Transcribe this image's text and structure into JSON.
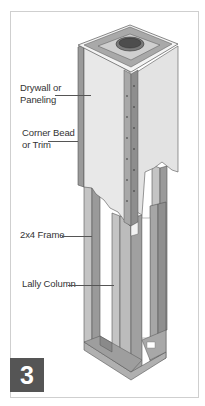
{
  "figure": {
    "number": "3",
    "colors": {
      "panel_face": "#e8e8e8",
      "panel_side": "#d2d2d2",
      "wood": "#b9b9b9",
      "wood_dark": "#8f8f8f",
      "badge": "#555555",
      "border": "#cfcfcf"
    }
  },
  "labels": [
    {
      "id": "drywall",
      "text_line1": "Drywall or",
      "text_line2": "Paneling"
    },
    {
      "id": "corner_bead",
      "text_line1": "Corner Bead",
      "text_line2": "or Trim"
    },
    {
      "id": "frame",
      "text_line1": "2x4 Frame"
    },
    {
      "id": "lally",
      "text_line1": "Lally Column"
    }
  ]
}
